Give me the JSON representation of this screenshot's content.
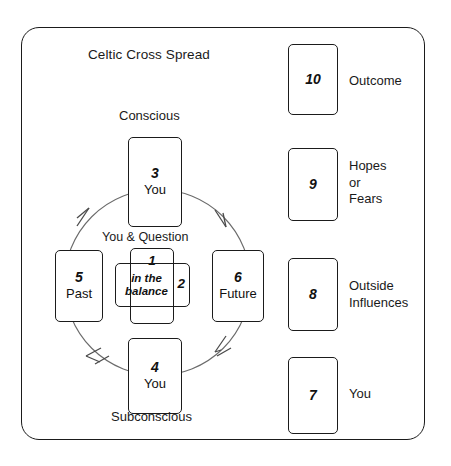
{
  "diagram": {
    "title": "Celtic Cross Spread",
    "labels": {
      "conscious": "Conscious",
      "subconscious": "Subconscious",
      "you_and_question": "You & Question"
    },
    "center_cards": [
      {
        "number": "1",
        "text": ""
      },
      {
        "number": "2",
        "text": "in the balance"
      }
    ],
    "cross_cards": [
      {
        "number": "3",
        "text": "You"
      },
      {
        "number": "4",
        "text": "You"
      },
      {
        "number": "5",
        "text": "Past"
      },
      {
        "number": "6",
        "text": "Future"
      }
    ],
    "staff_cards": [
      {
        "number": "10",
        "label": "Outcome"
      },
      {
        "number": "9",
        "label": "Hopes\nor\nFears"
      },
      {
        "number": "8",
        "label": "Outside\nInfluences"
      },
      {
        "number": "7",
        "label": "You"
      }
    ],
    "colors": {
      "border": "#1b1b1b",
      "background": "#ffffff",
      "text": "#111111",
      "arrow": "#5a5a5a"
    },
    "flow_direction": "clockwise"
  }
}
